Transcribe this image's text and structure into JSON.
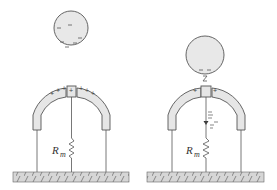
{
  "colors": {
    "stroke": "#555555",
    "fill": "#e6e6e6",
    "ground_fill": "#d4d4d4",
    "background": "#ffffff"
  },
  "left_panel": {
    "sphere_charge": "-",
    "arch_charge": "+",
    "resistor_label": "R",
    "resistor_subscript": "m"
  },
  "right_panel": {
    "sphere_charge": "-",
    "arch_charge": "+",
    "resistor_label": "R",
    "resistor_subscript": "m",
    "current_indicator": "arrow-down-with-minus"
  }
}
